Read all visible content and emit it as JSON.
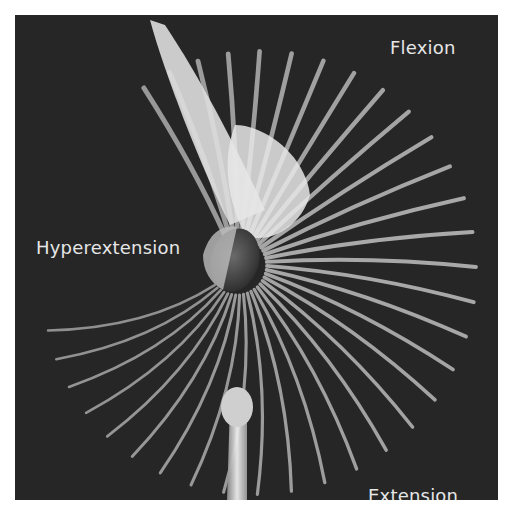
{
  "figure": {
    "labels": {
      "flexion": "Flexion",
      "hyperextension": "Hyperextension",
      "extension": "Extension"
    },
    "colors": {
      "background": "#262626",
      "bone": "#d9d9d9",
      "text": "#e6e6e6"
    }
  }
}
